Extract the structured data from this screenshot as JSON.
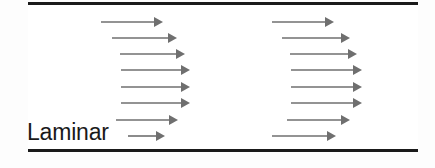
{
  "figure": {
    "label": "Laminar",
    "background_color": "#fdfdfd",
    "interior_color": "#ffffff",
    "wall_color": "#1a1a1a",
    "arrow_color": "#6f6f6f",
    "label_color": "#1a1a1a",
    "width": 435,
    "height": 168
  },
  "walls": {
    "top_label": "pipe-wall-top",
    "bottom_label": "pipe-wall-bottom",
    "left": 28,
    "right": 418,
    "thickness": 3,
    "top_y": 2,
    "bottom_y": 149
  },
  "chart_data": {
    "type": "line",
    "title": "Laminar",
    "xlabel": "",
    "ylabel": "",
    "grid": false,
    "legend": null,
    "annotations": [
      "Laminar"
    ],
    "series": [
      {
        "name": "profile-left",
        "x_tail": [
          101,
          112,
          120,
          121,
          121,
          121,
          116,
          128
        ],
        "x_tip": [
          163,
          177,
          185,
          190,
          190,
          190,
          178,
          165
        ],
        "y": [
          22,
          38,
          54,
          70,
          87,
          103,
          120,
          136
        ],
        "lengths": [
          62,
          65,
          65,
          69,
          69,
          69,
          62,
          37
        ]
      },
      {
        "name": "profile-right",
        "x_tail": [
          272,
          282,
          290,
          291,
          291,
          291,
          287,
          272
        ],
        "x_tip": [
          334,
          350,
          357,
          362,
          362,
          362,
          350,
          336
        ],
        "y": [
          22,
          38,
          54,
          70,
          87,
          103,
          120,
          136
        ],
        "lengths": [
          62,
          68,
          67,
          71,
          71,
          71,
          63,
          64
        ]
      }
    ],
    "arrow_count_per_profile": 8,
    "profile_count": 2
  }
}
